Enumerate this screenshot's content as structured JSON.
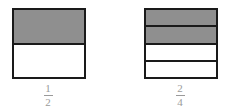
{
  "diagrams": [
    {
      "name": "one-half",
      "parts": 2,
      "shaded": 1,
      "numerator": "1",
      "denominator": "2"
    },
    {
      "name": "two-quarters",
      "parts": 4,
      "shaded": 2,
      "numerator": "2",
      "denominator": "4"
    }
  ],
  "colors": {
    "shaded": "#8f8f8f",
    "border": "#1a1a1a",
    "label": "#9a9a9a"
  }
}
